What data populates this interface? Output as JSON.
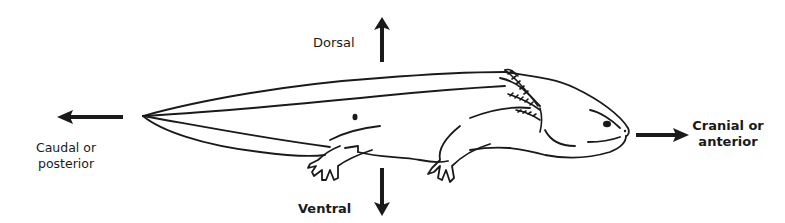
{
  "diagram": {
    "labels": {
      "dorsal": "Dorsal",
      "ventral": "Ventral",
      "caudal_line1": "Caudal or",
      "caudal_line2": "posterior",
      "cranial_line1": "Cranial or",
      "cranial_line2": "anterior"
    },
    "arrows": [
      {
        "name": "dorsal-arrow",
        "direction": "up"
      },
      {
        "name": "ventral-arrow",
        "direction": "down"
      },
      {
        "name": "caudal-arrow",
        "direction": "left"
      },
      {
        "name": "cranial-arrow",
        "direction": "right"
      }
    ],
    "colors": {
      "ink": "#1a1a1a",
      "background": "#ffffff"
    }
  }
}
